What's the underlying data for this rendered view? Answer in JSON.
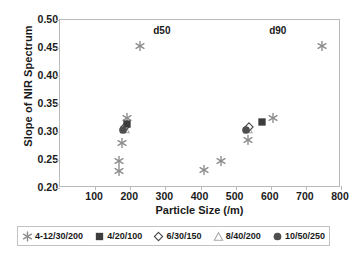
{
  "chart_data": {
    "type": "scatter",
    "title": "",
    "xlabel": "Particle Size (/m)",
    "ylabel": "Slope of NIR Spectrum",
    "xlim": [
      0,
      800
    ],
    "ylim": [
      0.2,
      0.5
    ],
    "xticks": [
      100,
      200,
      300,
      400,
      500,
      600,
      700,
      800
    ],
    "xtick_labels": [
      "100",
      "200",
      "300",
      "400",
      "500",
      "600",
      "700",
      "800"
    ],
    "yticks": [
      0.2,
      0.25,
      0.3,
      0.35,
      0.4,
      0.45,
      0.5
    ],
    "ytick_labels": [
      "0.20",
      "0.25",
      "0.30",
      "0.35",
      "0.40",
      "0.45",
      "0.50"
    ],
    "grid": false,
    "legend_position": "below",
    "annotations": [
      {
        "text": "d50",
        "x": 290,
        "y": 0.483
      },
      {
        "text": "d90",
        "x": 620,
        "y": 0.483
      }
    ],
    "series": [
      {
        "name": "4-12/30/200",
        "marker": "star",
        "color": "#8c8c8c",
        "points": [
          {
            "x": 228,
            "y": 0.453
          },
          {
            "x": 190,
            "y": 0.325
          },
          {
            "x": 176,
            "y": 0.281
          },
          {
            "x": 168,
            "y": 0.248
          },
          {
            "x": 168,
            "y": 0.231
          },
          {
            "x": 410,
            "y": 0.232
          },
          {
            "x": 458,
            "y": 0.249
          },
          {
            "x": 536,
            "y": 0.285
          },
          {
            "x": 606,
            "y": 0.325
          },
          {
            "x": 745,
            "y": 0.453
          }
        ]
      },
      {
        "name": "4/20/100",
        "marker": "filled-square",
        "color": "#3d3d3d",
        "points": [
          {
            "x": 191,
            "y": 0.314
          },
          {
            "x": 575,
            "y": 0.317
          }
        ]
      },
      {
        "name": "6/30/150",
        "marker": "open-diamond",
        "color": "#4a4a4a",
        "points": [
          {
            "x": 186,
            "y": 0.309
          },
          {
            "x": 539,
            "y": 0.309
          }
        ]
      },
      {
        "name": "8/40/200",
        "marker": "open-triangle",
        "color": "#a8a8a8",
        "points": [
          {
            "x": 184,
            "y": 0.306
          },
          {
            "x": 534,
            "y": 0.305
          }
        ]
      },
      {
        "name": "10/50/250",
        "marker": "filled-circle",
        "color": "#4f4f4f",
        "points": [
          {
            "x": 180,
            "y": 0.303
          },
          {
            "x": 530,
            "y": 0.304
          }
        ]
      }
    ]
  },
  "legend": {
    "entries": [
      {
        "label": "4-12/30/200",
        "marker": "star"
      },
      {
        "label": "4/20/100",
        "marker": "filled-square"
      },
      {
        "label": "6/30/150",
        "marker": "open-diamond"
      },
      {
        "label": "8/40/200",
        "marker": "open-triangle"
      },
      {
        "label": "10/50/250",
        "marker": "filled-circle"
      }
    ]
  }
}
